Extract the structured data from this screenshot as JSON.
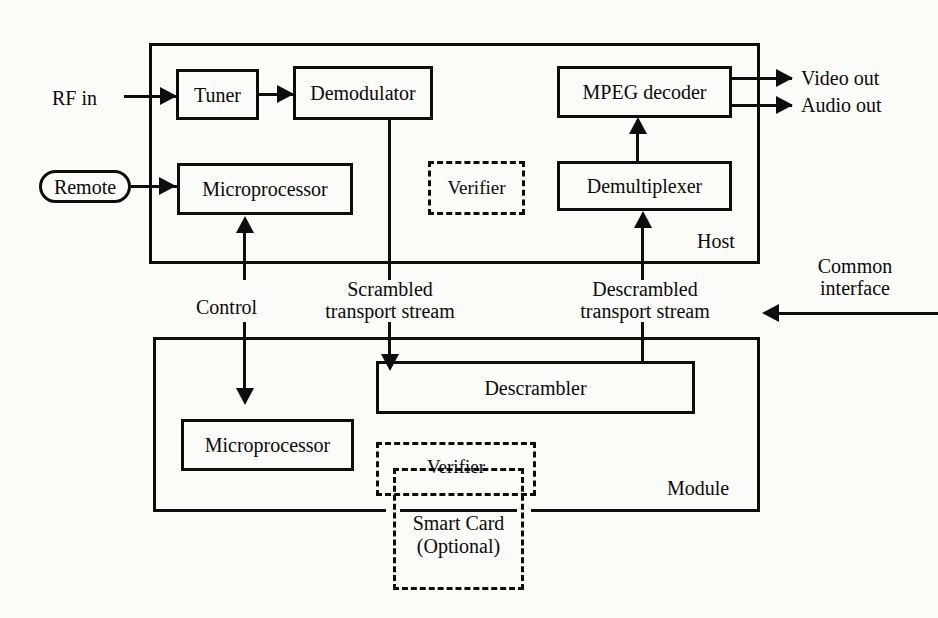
{
  "diagram": {
    "ink_color": "#0d0d0d",
    "paper_color": "#fbfbf8"
  },
  "host": {
    "container_label": "Host",
    "blocks": {
      "tuner": "Tuner",
      "demodulator": "Demodulator",
      "microprocessor": "Microprocessor",
      "verifier": "Verifier",
      "mpeg_decoder": "MPEG decoder",
      "demultiplexer": "Demultiplexer"
    }
  },
  "module": {
    "container_label": "Module",
    "blocks": {
      "microprocessor": "Microprocessor",
      "descrambler": "Descrambler",
      "verifier": "Verifier",
      "smart_card_line1": "Smart Card",
      "smart_card_line2": "(Optional)"
    }
  },
  "io": {
    "rf_in": "RF in",
    "remote": "Remote",
    "video_out": "Video out",
    "audio_out": "Audio out",
    "common_interface_line1": "Common",
    "common_interface_line2": "interface"
  },
  "signals": {
    "control": "Control",
    "scrambled_line1": "Scrambled",
    "scrambled_line2": "transport stream",
    "descrambled_line1": "Descrambled",
    "descrambled_line2": "transport stream"
  }
}
